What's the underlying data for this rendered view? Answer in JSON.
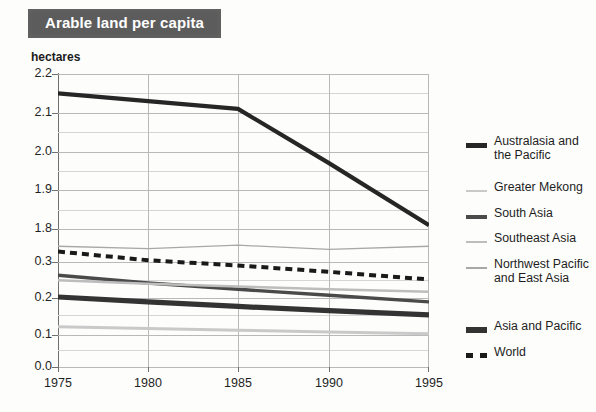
{
  "title": "Arable land per capita",
  "unit_label": "hectares",
  "legend": {
    "items": [
      {
        "label": "Australasia and the Pacific",
        "style": "solid-thick",
        "color": "#262626",
        "top": 14
      },
      {
        "label": "Greater Mekong",
        "style": "solid-thin",
        "color": "#c9c9c9",
        "top": 60
      },
      {
        "label": "South Asia",
        "style": "solid-med",
        "color": "#4a4a4a",
        "top": 86
      },
      {
        "label": "Southeast Asia",
        "style": "solid-thin",
        "color": "#bdbdbd",
        "top": 111
      },
      {
        "label": "Northwest Pacific and East Asia",
        "style": "solid-thin",
        "color": "#a8a8a8",
        "top": 137
      },
      {
        "label": "Asia and Pacific",
        "style": "solid-thickest",
        "color": "#333333",
        "top": 199
      },
      {
        "label": "World",
        "style": "dashed",
        "color": "#1a1a1a",
        "top": 225
      }
    ]
  },
  "chart_data": {
    "type": "line",
    "title": "Arable land per capita",
    "xlabel": "",
    "ylabel": "hectares",
    "x": [
      1975,
      1980,
      1985,
      1990,
      1995
    ],
    "xtick_labels": [
      "1975",
      "1980",
      "1985",
      "1990",
      "1995"
    ],
    "ytick_labels": [
      "2.2",
      "2.1",
      "2.0",
      "1.9",
      "1.8",
      "0.3",
      "0.2",
      "0.1",
      "0.0"
    ],
    "y_axis_note": "broken scale: upper band 1.8-2.2, lower band 0.0-0.3",
    "grid": true,
    "legend_position": "right",
    "series": [
      {
        "name": "Australasia and the Pacific",
        "color": "#262626",
        "width": 4.2,
        "dash": "none",
        "band": "upper",
        "values": [
          2.15,
          2.13,
          2.11,
          1.97,
          1.81
        ]
      },
      {
        "name": "Northwest Pacific and East Asia",
        "color": "#a8a8a8",
        "width": 1.3,
        "dash": "none",
        "band": "lower",
        "values": [
          0.345,
          0.338,
          0.348,
          0.336,
          0.345
        ]
      },
      {
        "name": "World",
        "color": "#1a1a1a",
        "width": 4.0,
        "dash": "7,5",
        "band": "lower",
        "values": [
          0.33,
          0.305,
          0.29,
          0.272,
          0.25
        ]
      },
      {
        "name": "South Asia",
        "color": "#4a4a4a",
        "width": 3.4,
        "dash": "none",
        "band": "lower",
        "values": [
          0.262,
          0.24,
          0.222,
          0.205,
          0.186
        ]
      },
      {
        "name": "Southeast Asia",
        "color": "#bdbdbd",
        "width": 2.4,
        "dash": "none",
        "band": "lower",
        "values": [
          0.248,
          0.238,
          0.23,
          0.222,
          0.215
        ]
      },
      {
        "name": "Asia and Pacific",
        "color": "#333333",
        "width": 5.2,
        "dash": "none",
        "band": "lower",
        "values": [
          0.2,
          0.186,
          0.173,
          0.161,
          0.149
        ]
      },
      {
        "name": "Greater Mekong",
        "color": "#c9c9c9",
        "width": 3.0,
        "dash": "none",
        "band": "lower",
        "values": [
          0.115,
          0.11,
          0.105,
          0.1,
          0.095
        ]
      }
    ]
  }
}
